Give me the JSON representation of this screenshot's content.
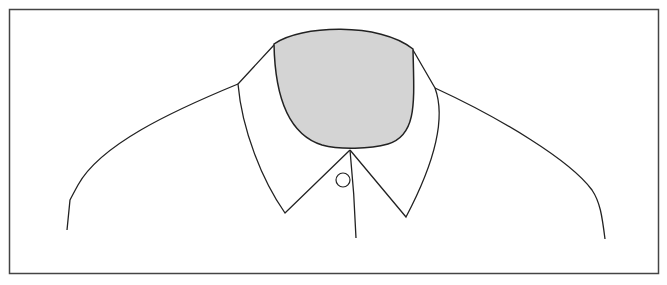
{
  "illustration": {
    "subject": "shirt collar outline with blank face area",
    "colors": {
      "background": "#ffffff",
      "stroke": "#222222",
      "face_fill": "#d4d4d4",
      "frame": "#444444"
    },
    "parts": [
      "frame",
      "face-shape",
      "left-collar",
      "right-collar",
      "left-shoulder",
      "right-shoulder",
      "placket-line",
      "collar-button"
    ]
  }
}
